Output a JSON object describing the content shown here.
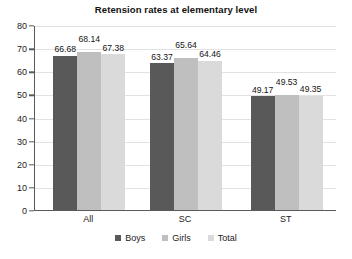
{
  "chart_data": {
    "type": "bar",
    "title": "Retension rates at elementary level",
    "xlabel": "",
    "ylabel": "",
    "ylim": [
      0,
      80
    ],
    "ytick_step": 10,
    "yticks": [
      "80",
      "70",
      "60",
      "50",
      "40",
      "30",
      "20",
      "10",
      "0"
    ],
    "grid": true,
    "legend_position": "bottom",
    "categories": [
      "All",
      "SC",
      "ST"
    ],
    "series": [
      {
        "name": "Boys",
        "color": "#595959",
        "values": [
          66.68,
          63.37,
          49.17
        ]
      },
      {
        "name": "Girls",
        "color": "#bfbfbf",
        "values": [
          68.14,
          65.64,
          49.53
        ]
      },
      {
        "name": "Total",
        "color": "#dadada",
        "values": [
          67.38,
          64.46,
          49.35
        ]
      }
    ],
    "data_labels": [
      [
        "66.68",
        "68.14",
        "67.38"
      ],
      [
        "63.37",
        "65.64",
        "64.46"
      ],
      [
        "49.17",
        "49.53",
        "49.35"
      ]
    ]
  },
  "legend": {
    "items": [
      {
        "label": "Boys"
      },
      {
        "label": "Girls"
      },
      {
        "label": "Total"
      }
    ]
  }
}
